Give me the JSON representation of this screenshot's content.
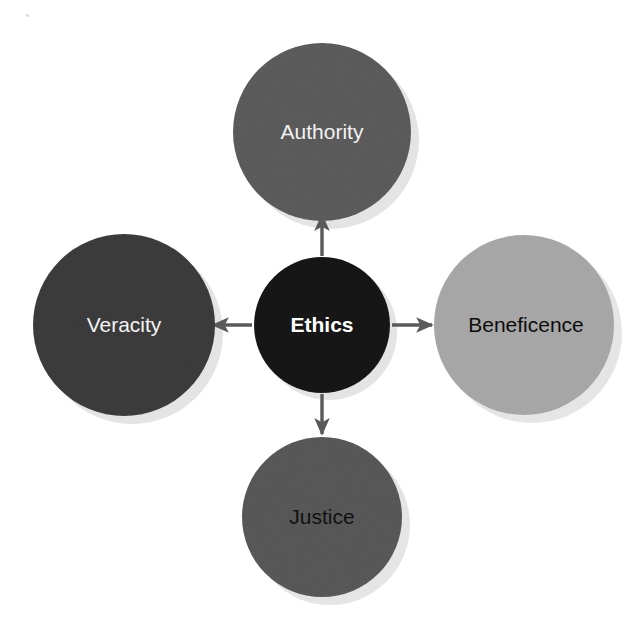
{
  "diagram": {
    "type": "hub-and-spoke",
    "title": "Ethics",
    "background_color": "#ffffff",
    "width": 639,
    "height": 625,
    "center_node": {
      "label": "Ethics",
      "cx": 322,
      "cy": 325,
      "r": 68,
      "fill": "#141414",
      "text_color": "#ffffff",
      "font_weight": "bold"
    },
    "nodes": [
      {
        "id": "authority",
        "label": "Authority",
        "position": "top",
        "cx": 322,
        "cy": 132,
        "r": 89,
        "fill": "#5c5c5c",
        "text_color": "#f2f2f2",
        "font_weight": "normal"
      },
      {
        "id": "veracity",
        "label": "Veracity",
        "position": "left",
        "cx": 124,
        "cy": 325,
        "r": 91,
        "fill": "#3c3c3c",
        "text_color": "#f4f4f4",
        "font_weight": "normal"
      },
      {
        "id": "beneficence",
        "label": "Beneficence",
        "position": "right",
        "cx": 524,
        "cy": 325,
        "r": 90,
        "fill": "#a9a9a9",
        "text_color": "#0d0d0d",
        "font_weight": "normal"
      },
      {
        "id": "justice",
        "label": "Justice",
        "position": "bottom",
        "cx": 322,
        "cy": 517,
        "r": 80,
        "fill": "#595959",
        "text_color": "#111111",
        "font_weight": "normal"
      }
    ],
    "arrows": [
      {
        "id": "arrow-up",
        "from": "Ethics",
        "to": "Authority",
        "direction": "up",
        "color": "#5a5a5a"
      },
      {
        "id": "arrow-right",
        "from": "Ethics",
        "to": "Beneficence",
        "direction": "right",
        "color": "#5a5a5a"
      },
      {
        "id": "arrow-down",
        "from": "Ethics",
        "to": "Justice",
        "direction": "down",
        "color": "#5a5a5a"
      },
      {
        "id": "arrow-left",
        "from": "Ethics",
        "to": "Veracity",
        "direction": "left",
        "color": "#5a5a5a"
      }
    ],
    "shadow_color": "#cfcfcf"
  }
}
